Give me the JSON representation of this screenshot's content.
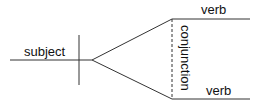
{
  "diagram": {
    "type": "sentence-diagram",
    "subject_label": "subject",
    "conjunction_label": "conjunction",
    "verb_top_label": "verb",
    "verb_bottom_label": "verb",
    "line_color": "#333333"
  }
}
